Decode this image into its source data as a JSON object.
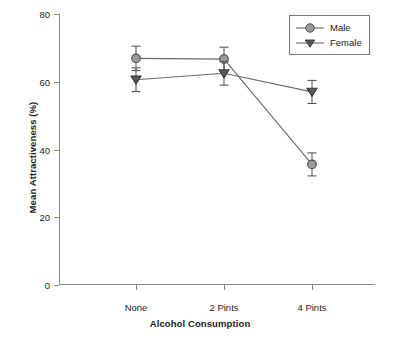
{
  "chart_data": {
    "type": "line",
    "title": "",
    "xlabel": "Alcohol Consumption",
    "ylabel": "Mean Attractiveness (%)",
    "categories": [
      "None",
      "2 Pints",
      "4 Pints"
    ],
    "ylim": [
      0,
      80
    ],
    "yticks": [
      0,
      20,
      40,
      60,
      80
    ],
    "ytick_labels": [
      "0",
      "20",
      "40",
      "60",
      "80"
    ],
    "grid": false,
    "legend_position": "top-right",
    "series": [
      {
        "name": "Male",
        "marker": "circle",
        "color": "#9a9a9a",
        "values": [
          66.9,
          66.7,
          35.6
        ],
        "errors": [
          3.6,
          3.5,
          3.4
        ]
      },
      {
        "name": "Female",
        "marker": "triangle-down",
        "color": "#5a5a5a",
        "values": [
          60.6,
          62.5,
          57.0
        ],
        "errors": [
          3.5,
          3.5,
          3.4
        ]
      }
    ]
  },
  "legend": {
    "entries": [
      {
        "label": "Male"
      },
      {
        "label": "Female"
      }
    ]
  },
  "colors": {
    "axis": "#8a8a8a",
    "line": "#6a6a6a",
    "male_fill": "#9a9a9a",
    "female_fill": "#5a5a5a",
    "text": "#1b1b1b"
  }
}
